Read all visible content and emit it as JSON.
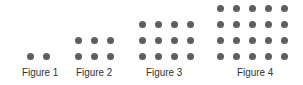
{
  "figures": [
    {
      "label": "Figure 1",
      "rows": 1,
      "cols": 2,
      "x0": 27,
      "label_x": 22
    },
    {
      "label": "Figure 2",
      "rows": 2,
      "cols": 3,
      "x0": 75,
      "label_x": 76
    },
    {
      "label": "Figure 3",
      "rows": 3,
      "cols": 4,
      "x0": 139,
      "label_x": 146
    },
    {
      "label": "Figure 4",
      "rows": 4,
      "cols": 5,
      "x0": 217,
      "label_x": 237
    }
  ],
  "spacing": 16,
  "bottom_row_y": 54,
  "dot_color": "#5f5f5f"
}
